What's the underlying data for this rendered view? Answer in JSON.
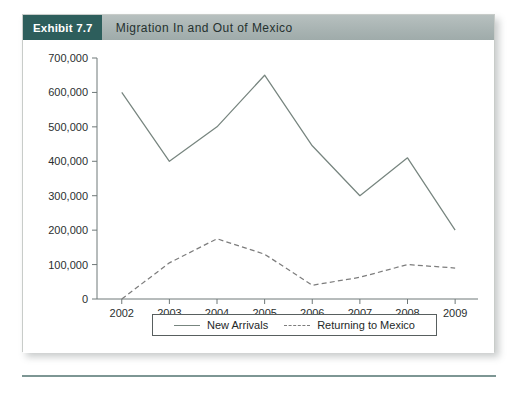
{
  "exhibit": {
    "badge_label": "Exhibit 7.7",
    "title": "Migration In and Out of Mexico"
  },
  "chart_data": {
    "type": "line",
    "title": "Migration In and Out of Mexico",
    "xlabel": "",
    "ylabel": "",
    "categories": [
      "2002",
      "2003",
      "2004",
      "2005",
      "2006",
      "2007",
      "2008",
      "2009"
    ],
    "x": [
      2002,
      2003,
      2004,
      2005,
      2006,
      2007,
      2008,
      2009
    ],
    "ylim": [
      0,
      700000
    ],
    "y_ticks": [
      0,
      100000,
      200000,
      300000,
      400000,
      500000,
      600000,
      700000
    ],
    "y_tick_labels": [
      "0",
      "100,000",
      "200,000",
      "300,000",
      "400,000",
      "500,000",
      "600,000",
      "700,000"
    ],
    "grid": false,
    "legend_position": "bottom",
    "series": [
      {
        "name": "New Arrivals",
        "style": "solid",
        "color": "#77857f",
        "values": [
          600000,
          400000,
          500000,
          650000,
          445000,
          300000,
          410000,
          200000
        ]
      },
      {
        "name": "Returning to Mexico",
        "style": "dashed",
        "color": "#7d7d7d",
        "values": [
          0,
          105000,
          175000,
          130000,
          40000,
          63000,
          100000,
          90000
        ]
      }
    ]
  },
  "legend": {
    "items": [
      {
        "label": "New Arrivals"
      },
      {
        "label": "Returning to Mexico"
      }
    ]
  },
  "colors": {
    "badge": "#2d5e5c",
    "header_bar": "#a9b4b3",
    "rule": "#7d9694",
    "axis": "#6f7878"
  }
}
